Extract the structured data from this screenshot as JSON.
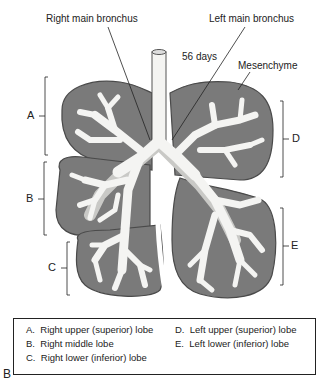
{
  "labels": {
    "right_main_bronchus": "Right main bronchus",
    "left_main_bronchus": "Left main bronchus",
    "age": "56 days",
    "mesenchyme": "Mesenchyme"
  },
  "lobe_markers": {
    "A": "A",
    "B": "B",
    "C": "C",
    "D": "D",
    "E": "E"
  },
  "legend": {
    "items": [
      {
        "key": "A.",
        "text": "Right upper (superior) lobe"
      },
      {
        "key": "B.",
        "text": "Right middle lobe"
      },
      {
        "key": "C.",
        "text": "Right lower (inferior) lobe"
      },
      {
        "key": "D.",
        "text": "Left upper (superior) lobe"
      },
      {
        "key": "E.",
        "text": "Left lower (inferior) lobe"
      }
    ]
  },
  "panel_label": "B",
  "colors": {
    "mesenchyme": "#7a7a7a",
    "mesenchyme_outline": "#4a4a4a",
    "bronchial_tree": "#f4f4f2",
    "bronchial_shadow": "#c9c9c6",
    "line": "#222222"
  }
}
